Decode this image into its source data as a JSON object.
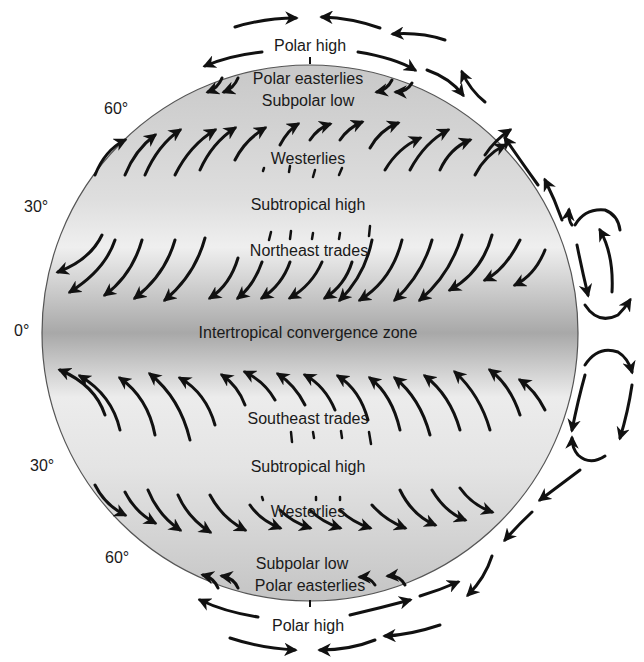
{
  "diagram": {
    "type": "global-atmospheric-circulation",
    "colors": {
      "globe_fill": "#cfcfcf",
      "globe_band": "#a9a9a9",
      "arrow": "#111111",
      "outline": "#555555"
    },
    "latitude_labels": [
      {
        "text": "60°",
        "x": 104,
        "y": 100
      },
      {
        "text": "30°",
        "x": 24,
        "y": 198
      },
      {
        "text": "0°",
        "x": 14,
        "y": 322
      },
      {
        "text": "30°",
        "x": 30,
        "y": 457
      },
      {
        "text": "60°",
        "x": 105,
        "y": 549
      }
    ],
    "zone_labels": [
      {
        "text": "Polar high",
        "x": 310,
        "y": 37
      },
      {
        "text": "Polar easterlies",
        "x": 308,
        "y": 73
      },
      {
        "text": "Subpolar low",
        "x": 308,
        "y": 95
      },
      {
        "text": "Westerlies",
        "x": 308,
        "y": 150
      },
      {
        "text": "Subtropical high",
        "x": 308,
        "y": 196
      },
      {
        "text": "Northeast trades",
        "x": 309,
        "y": 242
      },
      {
        "text": "Intertropical convergence zone",
        "x": 308,
        "y": 326
      },
      {
        "text": "Southeast trades",
        "x": 308,
        "y": 410
      },
      {
        "text": "Subtropical high",
        "x": 308,
        "y": 458
      },
      {
        "text": "Westerlies",
        "x": 308,
        "y": 504
      },
      {
        "text": "Subpolar low",
        "x": 302,
        "y": 557
      },
      {
        "text": "Polar easterlies",
        "x": 310,
        "y": 579
      },
      {
        "text": "Polar high",
        "x": 308,
        "y": 618
      }
    ]
  }
}
